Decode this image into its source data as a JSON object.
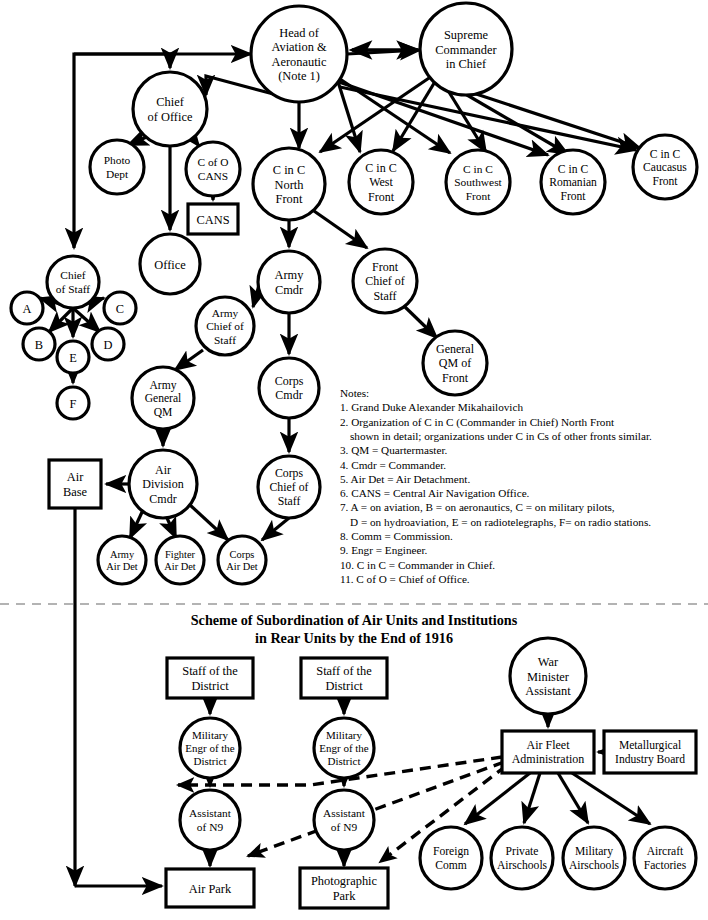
{
  "meta": {
    "lower_title_line1": "Scheme of Subordination of Air Units and Institutions",
    "lower_title_line2": "in Rear Units by the End of 1916"
  },
  "upper_nodes": [
    {
      "id": "head_av",
      "shape": "ellipse",
      "cx": 299,
      "cy": 54,
      "rx": 48,
      "ry": 48,
      "fs": 12.4,
      "lines": [
        "Head of",
        "Aviation &",
        "Aeronautic",
        "(Note 1)"
      ]
    },
    {
      "id": "supreme",
      "shape": "ellipse",
      "cx": 466,
      "cy": 49,
      "rx": 46,
      "ry": 46,
      "fs": 12.4,
      "lines": [
        "Supreme",
        "Commander",
        "in Chief"
      ]
    },
    {
      "id": "chief_off",
      "shape": "ellipse",
      "cx": 170,
      "cy": 109,
      "rx": 37,
      "ry": 37,
      "fs": 12.4,
      "lines": [
        "Chief",
        "of Office"
      ]
    },
    {
      "id": "photo",
      "shape": "ellipse",
      "cx": 117,
      "cy": 167,
      "rx": 27,
      "ry": 27,
      "fs": 11.4,
      "lines": [
        "Photo",
        "Dept"
      ]
    },
    {
      "id": "cofo_cans",
      "shape": "ellipse",
      "cx": 213,
      "cy": 169,
      "rx": 27,
      "ry": 27,
      "fs": 11.4,
      "lines": [
        "C of O",
        "CANS"
      ]
    },
    {
      "id": "cans_box",
      "shape": "rect",
      "cx": 213,
      "cy": 219,
      "w": 50,
      "h": 30,
      "fs": 12.4,
      "lines": [
        "CANS"
      ]
    },
    {
      "id": "office",
      "shape": "ellipse",
      "cx": 170,
      "cy": 264,
      "rx": 30,
      "ry": 30,
      "fs": 12.4,
      "lines": [
        "Office"
      ]
    },
    {
      "id": "cinc_n",
      "shape": "ellipse",
      "cx": 289,
      "cy": 184,
      "rx": 36,
      "ry": 36,
      "fs": 12.4,
      "lines": [
        "C in C",
        "North",
        "Front"
      ]
    },
    {
      "id": "cinc_w",
      "shape": "ellipse",
      "cx": 381,
      "cy": 182,
      "rx": 32,
      "ry": 32,
      "fs": 12.0,
      "lines": [
        "C in C",
        "West",
        "Front"
      ]
    },
    {
      "id": "cinc_sw",
      "shape": "ellipse",
      "cx": 478,
      "cy": 182,
      "rx": 32,
      "ry": 32,
      "fs": 11.4,
      "lines": [
        "C in C",
        "Southwest",
        "Front"
      ]
    },
    {
      "id": "cinc_ro",
      "shape": "ellipse",
      "cx": 573,
      "cy": 182,
      "rx": 32,
      "ry": 32,
      "fs": 11.6,
      "lines": [
        "C in C",
        "Romanian",
        "Front"
      ]
    },
    {
      "id": "cinc_ca",
      "shape": "ellipse",
      "cx": 665,
      "cy": 167,
      "rx": 32,
      "ry": 32,
      "fs": 11.6,
      "lines": [
        "C in C",
        "Caucasus",
        "Front"
      ]
    },
    {
      "id": "chief_st",
      "shape": "ellipse",
      "cx": 73,
      "cy": 282,
      "rx": 26,
      "ry": 26,
      "fs": 11.4,
      "lines": [
        "Chief",
        "of Staff"
      ]
    },
    {
      "id": "n_a",
      "shape": "ellipse",
      "cx": 27,
      "cy": 308,
      "rx": 16,
      "ry": 16,
      "fs": 12.4,
      "lines": [
        "A"
      ]
    },
    {
      "id": "n_c",
      "shape": "ellipse",
      "cx": 120,
      "cy": 308,
      "rx": 16,
      "ry": 16,
      "fs": 12.4,
      "lines": [
        "C"
      ]
    },
    {
      "id": "n_b",
      "shape": "ellipse",
      "cx": 39,
      "cy": 344,
      "rx": 16,
      "ry": 16,
      "fs": 12.4,
      "lines": [
        "B"
      ]
    },
    {
      "id": "n_e",
      "shape": "ellipse",
      "cx": 73,
      "cy": 357,
      "rx": 16,
      "ry": 16,
      "fs": 12.4,
      "lines": [
        "E"
      ]
    },
    {
      "id": "n_d",
      "shape": "ellipse",
      "cx": 108,
      "cy": 344,
      "rx": 16,
      "ry": 16,
      "fs": 12.4,
      "lines": [
        "D"
      ]
    },
    {
      "id": "n_f",
      "shape": "ellipse",
      "cx": 73,
      "cy": 403,
      "rx": 16,
      "ry": 16,
      "fs": 12.4,
      "lines": [
        "F"
      ]
    },
    {
      "id": "army_cmdr",
      "shape": "ellipse",
      "cx": 289,
      "cy": 282,
      "rx": 31,
      "ry": 31,
      "fs": 12.4,
      "lines": [
        "Army",
        "Cmdr"
      ]
    },
    {
      "id": "front_cos",
      "shape": "ellipse",
      "cx": 385,
      "cy": 281,
      "rx": 32,
      "ry": 32,
      "fs": 12.0,
      "lines": [
        "Front",
        "Chief of",
        "Staff"
      ]
    },
    {
      "id": "gen_qm_f",
      "shape": "ellipse",
      "cx": 455,
      "cy": 363,
      "rx": 32,
      "ry": 32,
      "fs": 12.0,
      "lines": [
        "General",
        "QM of",
        "Front"
      ]
    },
    {
      "id": "army_cos",
      "shape": "ellipse",
      "cx": 225,
      "cy": 326,
      "rx": 29,
      "ry": 29,
      "fs": 11.4,
      "lines": [
        "Army",
        "Chief of",
        "Staff"
      ]
    },
    {
      "id": "army_qm",
      "shape": "ellipse",
      "cx": 163,
      "cy": 398,
      "rx": 31,
      "ry": 31,
      "fs": 11.6,
      "lines": [
        "Army",
        "General",
        "QM"
      ]
    },
    {
      "id": "corps_cmdr",
      "shape": "ellipse",
      "cx": 289,
      "cy": 388,
      "rx": 30,
      "ry": 30,
      "fs": 12.0,
      "lines": [
        "Corps",
        "Cmdr"
      ]
    },
    {
      "id": "corps_cos",
      "shape": "ellipse",
      "cx": 289,
      "cy": 487,
      "rx": 31,
      "ry": 31,
      "fs": 11.8,
      "lines": [
        "Corps",
        "Chief of",
        "Staff"
      ]
    },
    {
      "id": "air_div",
      "shape": "ellipse",
      "cx": 163,
      "cy": 484,
      "rx": 34,
      "ry": 34,
      "fs": 12.0,
      "lines": [
        "Air",
        "Division",
        "Cmdr"
      ]
    },
    {
      "id": "air_base",
      "shape": "rect",
      "cx": 75,
      "cy": 484,
      "w": 52,
      "h": 48,
      "fs": 12.4,
      "lines": [
        "Air",
        "Base"
      ]
    },
    {
      "id": "army_ad",
      "shape": "ellipse",
      "cx": 122,
      "cy": 560,
      "rx": 24,
      "ry": 24,
      "fs": 10.4,
      "lines": [
        "Army",
        "Air Det"
      ]
    },
    {
      "id": "fight_ad",
      "shape": "ellipse",
      "cx": 180,
      "cy": 560,
      "rx": 24,
      "ry": 24,
      "fs": 10.4,
      "lines": [
        "Fighter",
        "Air Det"
      ]
    },
    {
      "id": "corps_ad",
      "shape": "ellipse",
      "cx": 242,
      "cy": 560,
      "rx": 24,
      "ry": 24,
      "fs": 10.4,
      "lines": [
        "Corps",
        "Air Det"
      ]
    }
  ],
  "lower_nodes": [
    {
      "id": "staff1",
      "shape": "rect",
      "cx": 210,
      "cy": 678,
      "w": 86,
      "h": 40,
      "fs": 12.4,
      "lines": [
        "Staff of the",
        "District"
      ]
    },
    {
      "id": "staff2",
      "shape": "rect",
      "cx": 344,
      "cy": 678,
      "w": 86,
      "h": 40,
      "fs": 12.4,
      "lines": [
        "Staff of the",
        "District"
      ]
    },
    {
      "id": "meng1",
      "shape": "ellipse",
      "cx": 210,
      "cy": 748,
      "rx": 30,
      "ry": 30,
      "fs": 11.0,
      "lines": [
        "Military",
        "Engr of the",
        "District"
      ]
    },
    {
      "id": "meng2",
      "shape": "ellipse",
      "cx": 344,
      "cy": 748,
      "rx": 30,
      "ry": 30,
      "fs": 11.0,
      "lines": [
        "Military",
        "Engr of the",
        "District"
      ]
    },
    {
      "id": "asst1",
      "shape": "ellipse",
      "cx": 210,
      "cy": 820,
      "rx": 30,
      "ry": 30,
      "fs": 11.4,
      "lines": [
        "Assistant",
        "of N9"
      ]
    },
    {
      "id": "asst2",
      "shape": "ellipse",
      "cx": 344,
      "cy": 820,
      "rx": 30,
      "ry": 30,
      "fs": 11.4,
      "lines": [
        "Assistant",
        "of N9"
      ]
    },
    {
      "id": "airpark",
      "shape": "rect",
      "cx": 210,
      "cy": 888,
      "w": 88,
      "h": 38,
      "fs": 12.4,
      "lines": [
        "Air Park"
      ]
    },
    {
      "id": "photopark",
      "shape": "rect",
      "cx": 344,
      "cy": 888,
      "w": 88,
      "h": 40,
      "fs": 12.4,
      "lines": [
        "Photographic",
        "Park"
      ]
    },
    {
      "id": "warmin",
      "shape": "ellipse",
      "cx": 548,
      "cy": 676,
      "rx": 38,
      "ry": 38,
      "fs": 12.4,
      "lines": [
        "War",
        "Minister",
        "Assistant"
      ]
    },
    {
      "id": "airfleet",
      "shape": "rect",
      "cx": 548,
      "cy": 752,
      "w": 92,
      "h": 42,
      "fs": 12.0,
      "lines": [
        "Air Fleet",
        "Administration"
      ]
    },
    {
      "id": "metal",
      "shape": "rect",
      "cx": 650,
      "cy": 752,
      "w": 92,
      "h": 42,
      "fs": 11.6,
      "lines": [
        "Metallurgical",
        "Industry Board"
      ]
    },
    {
      "id": "foreign",
      "shape": "ellipse",
      "cx": 451,
      "cy": 858,
      "rx": 31,
      "ry": 31,
      "fs": 11.6,
      "lines": [
        "Foreign",
        "Comm"
      ]
    },
    {
      "id": "privair",
      "shape": "ellipse",
      "cx": 522,
      "cy": 858,
      "rx": 31,
      "ry": 31,
      "fs": 11.6,
      "lines": [
        "Private",
        "Airschools"
      ]
    },
    {
      "id": "milair",
      "shape": "ellipse",
      "cx": 594,
      "cy": 858,
      "rx": 31,
      "ry": 31,
      "fs": 11.6,
      "lines": [
        "Military",
        "Airschools"
      ]
    },
    {
      "id": "aircraft",
      "shape": "ellipse",
      "cx": 665,
      "cy": 858,
      "rx": 31,
      "ry": 31,
      "fs": 11.6,
      "lines": [
        "Aircraft",
        "Factories"
      ]
    }
  ],
  "notes": {
    "heading": "Notes:",
    "items": [
      "1. Grand Duke Alexander Mikahailovich",
      "2. Organization of C in C (Commander in Chief) North Front",
      "    shown in detail; organizations under C in Cs of other fronts similar.",
      "3. QM = Quartermaster.",
      "4. Cmdr = Commander.",
      "5. Air Det = Air Detachment.",
      "6. CANS = Central Air Navigation Office.",
      "7. A = on aviation, B = on aeronautics, C = on military pilots,",
      "    D = on hydroaviation, E = on radiotelegraphs, F= on radio stations.",
      "8. Comm = Commission.",
      "9. Engr = Engineer.",
      "10. C in C = Commander in Chief.",
      "11. C of O = Chief of Office."
    ]
  },
  "colors": {
    "stroke": "#000000",
    "fill": "#ffffff",
    "divider": "#9a9a9a"
  },
  "edges_solid": [
    "M251,54 L251,54",
    "M347,54 L420,50",
    "M299,102 L299,148",
    "M281,96 L206,76 L206,95",
    "M251,54 L74,54 L74,248",
    "M74,54 L170,54 L170,68",
    "M149,136 L128,145",
    "M192,137 L199,146",
    "M170,146 L170,230",
    "M213,196 L213,200",
    "M335,72 L360,152",
    "M337,77 L450,153",
    "M339,82 L548,155",
    "M340,87 L636,150",
    "M432,76 L320,152",
    "M436,80 L393,151",
    "M444,84 L486,152",
    "M455,88 L568,154",
    "M464,90 L640,148",
    "M289,220 L289,247",
    "M314,211 L367,248",
    "M289,313 L289,354",
    "M264,267 L253,307",
    "M203,350 L175,370",
    "M163,429 L163,446",
    "M289,418 L289,452",
    "M289,518 L262,540",
    "M143,510 L130,538",
    "M167,518 L176,538",
    "M190,505 L228,540",
    "M129,484 L106,484",
    "M75,508 L75,886",
    "M75,886 L162,886",
    "M73,308 L40,298",
    "M73,308 L49,332",
    "M73,308 L104,298",
    "M73,308 L100,332",
    "M73,308 L73,337",
    "M73,373 L73,383",
    "M405,307 L437,338",
    "M210,698 L210,714",
    "M344,698 L344,714",
    "M210,778 L210,786",
    "M344,778 L344,786",
    "M210,850 L210,866",
    "M344,850 L344,866",
    "M548,714 L548,727",
    "M604,752 L598,752",
    "M530,773 L465,824",
    "M540,773 L524,823",
    "M558,773 L588,823",
    "M572,773 L650,824"
  ],
  "edges_dashed": [
    "M502,757 L310,785 L178,785",
    "M504,762 L248,856",
    "M506,766 L380,862"
  ]
}
